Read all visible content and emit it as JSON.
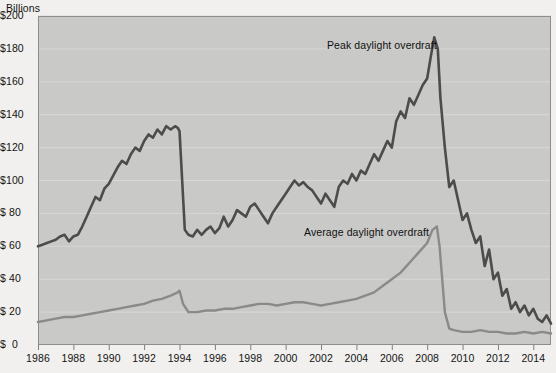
{
  "axis_unit_label": "Billions",
  "y_axis": {
    "labels": [
      "$200",
      "$180",
      "$160",
      "$140",
      "$120",
      "$100",
      "$ 80",
      "$ 60",
      "$ 40",
      "$ 20",
      "$  0"
    ],
    "values": [
      200,
      180,
      160,
      140,
      120,
      100,
      80,
      60,
      40,
      20,
      0
    ]
  },
  "x_axis": {
    "labels": [
      "1986",
      "1988",
      "1990",
      "1992",
      "1994",
      "1996",
      "1998",
      "2000",
      "2002",
      "2004",
      "2006",
      "2008",
      "2010",
      "2012",
      "2014"
    ],
    "values": [
      1986,
      1988,
      1990,
      1992,
      1994,
      1996,
      1998,
      2000,
      2002,
      2004,
      2006,
      2008,
      2010,
      2012,
      2014
    ]
  },
  "annotations": {
    "peak": "Peak daylight overdraft",
    "average": "Average daylight overdraft"
  },
  "colors": {
    "page_background": "#f1f0ee",
    "plot_background": "#c9c9c7",
    "gridline": "#d8d8d6",
    "plot_border": "#8d8d8b",
    "peak_line": "#4c4c4c",
    "average_line": "#8a8a88",
    "text": "#141414"
  },
  "chart_data": {
    "type": "line",
    "title": "",
    "subtitle": "",
    "xlabel": "",
    "ylabel": "Billions",
    "ylim": [
      0,
      200
    ],
    "xlim": [
      1986,
      2015
    ],
    "grid": true,
    "legend": "annotations-inline",
    "y_tick_step": 20,
    "x_tick_step": 2,
    "units": "US dollars, billions",
    "series": [
      {
        "name": "Peak daylight overdraft",
        "color": "#4c4c4c",
        "x": [
          1986.0,
          1986.25,
          1986.5,
          1986.75,
          1987.0,
          1987.25,
          1987.5,
          1987.75,
          1988.0,
          1988.25,
          1988.5,
          1988.75,
          1989.0,
          1989.25,
          1989.5,
          1989.75,
          1990.0,
          1990.25,
          1990.5,
          1990.75,
          1991.0,
          1991.25,
          1991.5,
          1991.75,
          1992.0,
          1992.25,
          1992.5,
          1992.75,
          1993.0,
          1993.25,
          1993.5,
          1993.75,
          1993.9,
          1994.0,
          1994.15,
          1994.3,
          1994.5,
          1994.75,
          1995.0,
          1995.25,
          1995.5,
          1995.75,
          1996.0,
          1996.25,
          1996.5,
          1996.75,
          1997.0,
          1997.25,
          1997.5,
          1997.75,
          1998.0,
          1998.25,
          1998.5,
          1998.75,
          1999.0,
          1999.25,
          1999.5,
          1999.75,
          2000.0,
          2000.25,
          2000.5,
          2000.75,
          2001.0,
          2001.25,
          2001.5,
          2001.75,
          2002.0,
          2002.25,
          2002.5,
          2002.75,
          2003.0,
          2003.25,
          2003.5,
          2003.75,
          2004.0,
          2004.25,
          2004.5,
          2004.75,
          2005.0,
          2005.25,
          2005.5,
          2005.75,
          2006.0,
          2006.25,
          2006.5,
          2006.75,
          2007.0,
          2007.25,
          2007.5,
          2007.75,
          2008.0,
          2008.2,
          2008.4,
          2008.6,
          2008.75,
          2009.0,
          2009.25,
          2009.5,
          2009.75,
          2010.0,
          2010.25,
          2010.5,
          2010.75,
          2011.0,
          2011.25,
          2011.5,
          2011.75,
          2012.0,
          2012.25,
          2012.5,
          2012.75,
          2013.0,
          2013.25,
          2013.5,
          2013.75,
          2014.0,
          2014.25,
          2014.5,
          2014.75,
          2015.0
        ],
        "y": [
          60,
          61,
          62,
          63,
          64,
          66,
          67,
          63,
          66,
          67,
          72,
          78,
          84,
          90,
          88,
          95,
          98,
          103,
          108,
          112,
          110,
          116,
          120,
          118,
          124,
          128,
          126,
          131,
          128,
          133,
          131,
          133,
          132,
          130,
          100,
          70,
          67,
          66,
          70,
          67,
          70,
          72,
          68,
          71,
          78,
          72,
          76,
          82,
          80,
          78,
          84,
          86,
          82,
          78,
          74,
          80,
          84,
          88,
          92,
          96,
          100,
          97,
          99,
          96,
          94,
          90,
          86,
          92,
          88,
          84,
          96,
          100,
          98,
          104,
          100,
          106,
          104,
          110,
          116,
          112,
          118,
          124,
          120,
          136,
          142,
          138,
          150,
          146,
          152,
          158,
          162,
          175,
          187,
          180,
          150,
          120,
          96,
          100,
          88,
          76,
          80,
          70,
          62,
          66,
          48,
          58,
          40,
          44,
          30,
          34,
          22,
          26,
          20,
          24,
          18,
          22,
          16,
          14,
          18,
          13
        ],
        "peak_value": 187,
        "peak_year": 2008,
        "start_value": 60
      },
      {
        "name": "Average daylight overdraft",
        "color": "#8a8a88",
        "x": [
          1986.0,
          1986.5,
          1987.0,
          1987.5,
          1988.0,
          1988.5,
          1989.0,
          1989.5,
          1990.0,
          1990.5,
          1991.0,
          1991.5,
          1992.0,
          1992.5,
          1993.0,
          1993.5,
          1993.9,
          1994.0,
          1994.2,
          1994.5,
          1995.0,
          1995.5,
          1996.0,
          1996.5,
          1997.0,
          1997.5,
          1998.0,
          1998.5,
          1999.0,
          1999.5,
          2000.0,
          2000.5,
          2001.0,
          2001.5,
          2002.0,
          2002.5,
          2003.0,
          2003.5,
          2004.0,
          2004.5,
          2005.0,
          2005.5,
          2006.0,
          2006.5,
          2007.0,
          2007.5,
          2008.0,
          2008.3,
          2008.55,
          2008.7,
          2009.0,
          2009.25,
          2009.5,
          2010.0,
          2010.5,
          2011.0,
          2011.5,
          2012.0,
          2012.5,
          2013.0,
          2013.5,
          2014.0,
          2014.5,
          2015.0
        ],
        "y": [
          14,
          15,
          16,
          17,
          17,
          18,
          19,
          20,
          21,
          22,
          23,
          24,
          25,
          27,
          28,
          30,
          32,
          33,
          25,
          20,
          20,
          21,
          21,
          22,
          22,
          23,
          24,
          25,
          25,
          24,
          25,
          26,
          26,
          25,
          24,
          25,
          26,
          27,
          28,
          30,
          32,
          36,
          40,
          44,
          50,
          56,
          62,
          70,
          72,
          60,
          20,
          10,
          9,
          8,
          8,
          9,
          8,
          8,
          7,
          7,
          8,
          7,
          8,
          7
        ],
        "peak_value": 72,
        "peak_year": 2008,
        "start_value": 14
      }
    ]
  }
}
